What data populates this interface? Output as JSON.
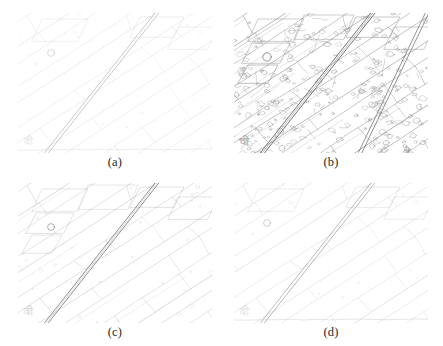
{
  "figure": {
    "type": "image-grid",
    "rows": 2,
    "columns": 2,
    "background_color": "#ffffff",
    "scene_description": "Aerial view of rectangular agricultural fields crossed by a diagonal road, rendered as four edge-detection results",
    "line_color": "#9a9a9a",
    "caption_color": "#2a2a2a"
  },
  "panels": [
    {
      "id": "a",
      "caption": "(a)",
      "density": "low",
      "line_opacity": 0.3,
      "stroke_color": "#a8a8a8",
      "road_stroke": "#8e8e8e",
      "detail_level": 1
    },
    {
      "id": "b",
      "caption": "(b)",
      "density": "high",
      "line_opacity": 0.85,
      "stroke_color": "#8a8a8a",
      "road_stroke": "#707070",
      "detail_level": 4
    },
    {
      "id": "c",
      "caption": "(c)",
      "density": "medium",
      "line_opacity": 0.5,
      "stroke_color": "#9c9c9c",
      "road_stroke": "#6e6e6e",
      "detail_level": 2
    },
    {
      "id": "d",
      "caption": "(d)",
      "density": "low-medium",
      "line_opacity": 0.38,
      "stroke_color": "#a4a4a4",
      "road_stroke": "#8a8a8a",
      "detail_level": 1
    }
  ]
}
